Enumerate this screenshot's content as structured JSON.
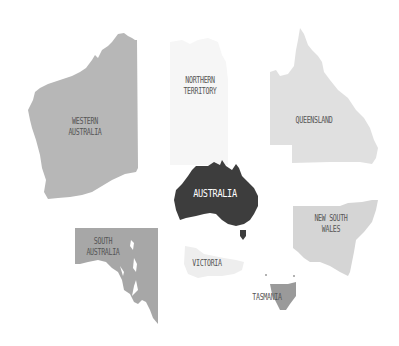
{
  "colors": {
    "background": "#ffffff",
    "western_australia": "#b7b7b7",
    "northern_territory": "#f6f6f6",
    "queensland": "#e0e0e0",
    "south_australia": "#a7a7a7",
    "new_south_wales": "#d5d5d5",
    "victoria": "#eeeeee",
    "tasmania": "#9a9a9a",
    "australia": "#3d3d3d",
    "label_dark": "#555555",
    "label_light": "#ffffff"
  },
  "regions": {
    "western_australia": {
      "line1": "WESTERN",
      "line2": "AUSTRALIA"
    },
    "northern_territory": {
      "line1": "NORTHERN",
      "line2": "TERRITORY"
    },
    "queensland": {
      "line1": "QUEENSLAND"
    },
    "australia": {
      "line1": "AUSTRALIA"
    },
    "south_australia": {
      "line1": "SOUTH",
      "line2": "AUSTRALIA"
    },
    "new_south_wales": {
      "line1": "NEW SOUTH",
      "line2": "WALES"
    },
    "victoria": {
      "line1": "VICTORIA"
    },
    "tasmania": {
      "line1": "TASMANIA"
    }
  }
}
